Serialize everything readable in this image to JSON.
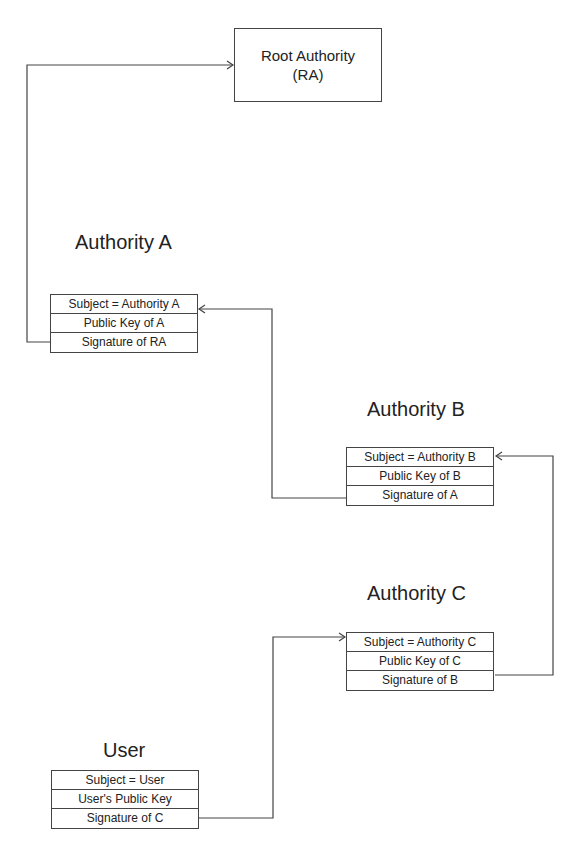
{
  "root": {
    "line1": "Root Authority",
    "line2": "(RA)"
  },
  "nodes": {
    "authority_a": {
      "title": "Authority A",
      "rows": [
        "Subject = Authority A",
        "Public Key of A",
        "Signature of RA"
      ]
    },
    "authority_b": {
      "title": "Authority B",
      "rows": [
        "Subject = Authority B",
        "Public Key of B",
        "Signature of A"
      ]
    },
    "authority_c": {
      "title": "Authority C",
      "rows": [
        "Subject = Authority C",
        "Public Key of C",
        "Signature of B"
      ]
    },
    "user": {
      "title": "User",
      "rows": [
        "Subject = User",
        "User's Public Key",
        "Signature of C"
      ]
    }
  },
  "colors": {
    "line": "#444444",
    "text": "#222222"
  }
}
